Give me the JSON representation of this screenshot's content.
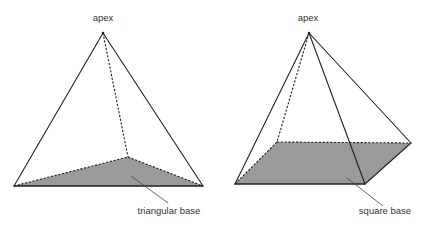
{
  "figures": [
    {
      "name": "triangular-pyramid",
      "apex_label": "apex",
      "base_label": "triangular base",
      "apex": [
        103,
        33
      ],
      "base_vertices": [
        [
          14,
          186
        ],
        [
          203,
          186
        ],
        [
          128,
          157
        ]
      ],
      "base_fill": "#9a9a9a",
      "label_positions": {
        "apex": [
          103,
          21
        ],
        "base": [
          169,
          214
        ]
      },
      "leader": [
        [
          131,
          176
        ],
        [
          168,
          203
        ]
      ]
    },
    {
      "name": "square-pyramid",
      "apex_label": "apex",
      "base_label": "square base",
      "apex": [
        309,
        33
      ],
      "base_vertices": [
        [
          235,
          184
        ],
        [
          365,
          184
        ],
        [
          411,
          143
        ],
        [
          277,
          142
        ]
      ],
      "base_fill": "#9a9a9a",
      "label_positions": {
        "apex": [
          308,
          21
        ],
        "base": [
          385,
          214
        ]
      },
      "leader": [
        [
          347,
          178
        ],
        [
          383,
          206
        ]
      ]
    }
  ],
  "colors": {
    "line": "#222222",
    "base_fill": "#9a9a9a",
    "text": "#333333"
  }
}
